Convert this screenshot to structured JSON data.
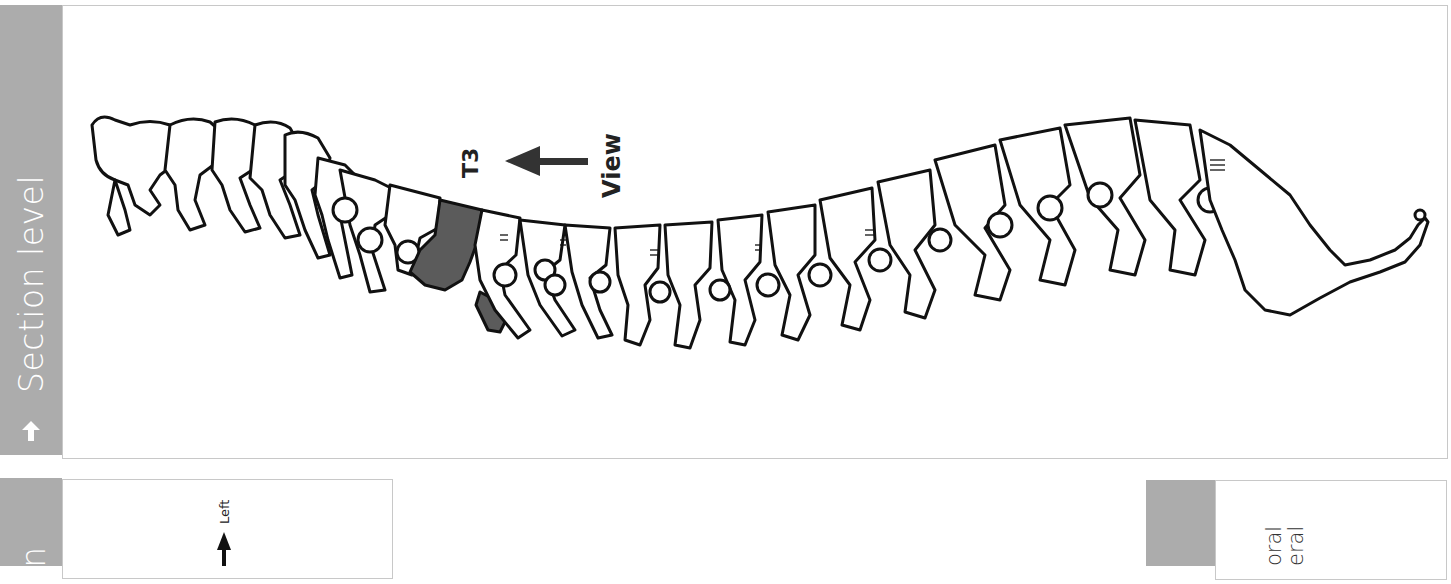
{
  "top_panel": {
    "tab_label": "Section level",
    "tab_icon": "arrow-up-icon",
    "figure": {
      "subject": "lateral view of vertebral column",
      "highlighted_vertebra": "T3",
      "highlight_color": "#5b5b5b",
      "view_label": "View",
      "level_label": "T3"
    }
  },
  "bottom_left_panel": {
    "tab_label_partial": "on",
    "direction_label": "Left"
  },
  "bottom_right_panel": {
    "lines_partial": [
      "oral",
      "eral"
    ]
  },
  "colors": {
    "tab_grey": "#acacac",
    "frame_border": "#c8c8c8",
    "ink": "#111111"
  }
}
